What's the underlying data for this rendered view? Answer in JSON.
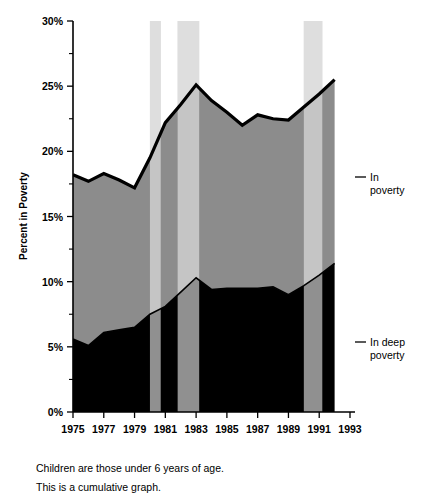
{
  "chart_data": {
    "type": "area",
    "stacked": true,
    "cumulative": true,
    "title": "",
    "xlabel": "",
    "ylabel": "Percent in Poverty",
    "xlim": [
      1975,
      1993
    ],
    "ylim": [
      0,
      30
    ],
    "ytick_labels": [
      "0%",
      "5%",
      "10%",
      "15%",
      "20%",
      "25%",
      "30%"
    ],
    "ytick_values": [
      0,
      5,
      10,
      15,
      20,
      25,
      30
    ],
    "yminor_values": [
      2.5,
      7.5,
      12.5,
      17.5,
      22.5,
      27.5
    ],
    "xtick_labels": [
      "1975",
      "1977",
      "1979",
      "1981",
      "1983",
      "1985",
      "1987",
      "1989",
      "1991",
      "1993"
    ],
    "xtick_values": [
      1975,
      1977,
      1979,
      1981,
      1983,
      1985,
      1987,
      1989,
      1991,
      1993
    ],
    "grid": false,
    "legend_position": "right",
    "x": [
      1975,
      1976,
      1977,
      1978,
      1979,
      1980,
      1981,
      1982,
      1983,
      1984,
      1985,
      1986,
      1987,
      1988,
      1989,
      1990,
      1991,
      1992
    ],
    "series": [
      {
        "name": "In deep poverty",
        "label": "In deep poverty",
        "color": "#000000",
        "values": [
          5.6,
          5.1,
          6.1,
          6.3,
          6.5,
          7.5,
          8.1,
          9.2,
          10.3,
          9.4,
          9.5,
          9.5,
          9.5,
          9.6,
          9.0,
          9.7,
          10.5,
          11.4
        ]
      },
      {
        "name": "In poverty",
        "label": "In poverty",
        "color": "#8c8c8c",
        "values": [
          18.2,
          17.7,
          18.3,
          17.8,
          17.2,
          19.5,
          22.2,
          23.6,
          25.1,
          23.9,
          23.0,
          22.0,
          22.8,
          22.5,
          22.4,
          23.4,
          24.4,
          25.5
        ]
      }
    ],
    "shaded_bands": [
      {
        "label": "recession",
        "start": 1980.0,
        "end": 1980.7,
        "color": "#cccccc"
      },
      {
        "label": "recession",
        "start": 1981.8,
        "end": 1983.2,
        "color": "#cccccc"
      },
      {
        "label": "recession",
        "start": 1990.0,
        "end": 1991.2,
        "color": "#cccccc"
      }
    ],
    "annotations": [
      {
        "name": "in-poverty-legend",
        "text": "In poverty",
        "at_y": 18.0
      },
      {
        "name": "in-deep-poverty-legend",
        "text": "In deep poverty",
        "at_y": 5.4
      }
    ]
  },
  "legend": {
    "in_poverty_line1": "In",
    "in_poverty_line2": "poverty",
    "in_deep_poverty_line1": "In deep",
    "in_deep_poverty_line2": "poverty"
  },
  "caption": {
    "line1": "Children are those under 6 years of age.",
    "line2": "This is a cumulative graph."
  }
}
